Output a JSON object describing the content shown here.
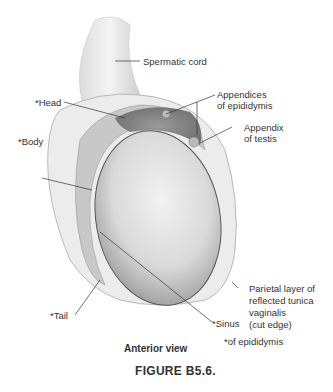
{
  "figure": {
    "view": "Anterior view",
    "caption": "FIGURE B5.6.",
    "footnote": "*of epididymis"
  },
  "labels": {
    "spermatic_cord": "Spermatic cord",
    "head": "*Head",
    "body": "*Body",
    "tail": "*Tail",
    "sinus": "*Sinus",
    "appendices_1": "Appendices",
    "appendices_2": "of epididymis",
    "appendix_1": "Appendix",
    "appendix_2": "of testis",
    "parietal_1": "Parietal layer of",
    "parietal_2": "reflected tunica",
    "parietal_3": "vaginalis",
    "parietal_4": "(cut edge)"
  },
  "colors": {
    "text": "#333333",
    "caption": "#3a3a3a",
    "testis": "#d8d8d8",
    "epididymis_head": "#8a8a8a",
    "tunica": "#e6e6e6"
  }
}
